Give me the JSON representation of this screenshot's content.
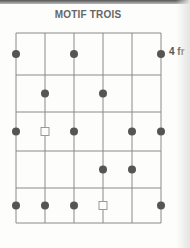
{
  "diagram": {
    "title": "MOTIF TROIS",
    "fret_label": "4 fr",
    "strings": 6,
    "frets": 5,
    "colors": {
      "grid": "#8a8a8a",
      "dot": "#555555",
      "square": "#9a9a9a",
      "title": "#666666"
    },
    "rows": [
      {
        "fret": 1,
        "dots": [
          1,
          3,
          6
        ],
        "squares": []
      },
      {
        "fret": 2,
        "dots": [
          2,
          4
        ],
        "squares": []
      },
      {
        "fret": 3,
        "dots": [
          1,
          3,
          5,
          6
        ],
        "squares": [
          2
        ]
      },
      {
        "fret": 4,
        "dots": [
          4,
          5
        ],
        "squares": []
      },
      {
        "fret": 5,
        "dots": [
          1,
          2,
          3,
          6
        ],
        "squares": [
          4
        ]
      }
    ]
  }
}
